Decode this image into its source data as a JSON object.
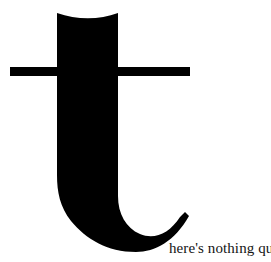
{
  "canvas": {
    "width": 271,
    "height": 262,
    "background_color": "#ffffff"
  },
  "logotype": {
    "letter": "t",
    "letter_color": "#000000",
    "style": "serif-didone-lowercase-t",
    "description": "oversized black lowercase serif t with concave top, heavy vertical stem, long horizontal crossbar and curving tail ending in a hook terminal"
  },
  "tagline": {
    "text": "here's nothing quite",
    "color": "#141414",
    "full_phrase": "there's nothing quite"
  }
}
